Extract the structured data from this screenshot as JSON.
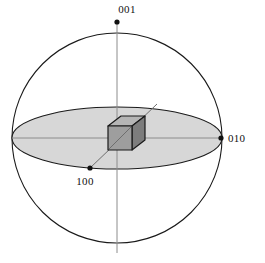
{
  "figure": {
    "background_color": "#ffffff",
    "sphere": {
      "name": "reference-sphere",
      "center_x": 117,
      "center_y": 138,
      "radius": 105,
      "stroke_color": "#1a1a1a",
      "stroke_width": 1.1,
      "fill_color": "none"
    },
    "equatorial_plane": {
      "name": "equatorial-plane-ellipse",
      "center_x": 117,
      "center_y": 138,
      "radius_x": 105,
      "radius_y": 31,
      "fill_color": "#d7d7d7",
      "stroke_color": "#1a1a1a",
      "stroke_width": 1.1
    },
    "cube": {
      "name": "unit-cube",
      "front_face_color": "#9e9e9e",
      "top_face_color": "#b5b5b5",
      "side_face_color": "#7d7d7d",
      "edge_color": "#1a1a1a",
      "edge_width": 1.2,
      "front_left": 108,
      "front_top": 126,
      "front_size": 24,
      "depth_dx": 13,
      "depth_dy": -10
    },
    "axes": [
      {
        "name": "axis-001",
        "label": "001",
        "label_x": 127,
        "label_y": 13,
        "marker_x": 117,
        "marker_y": 22,
        "line_x1": 117,
        "line_y1": 22,
        "line_x2": 117,
        "line_y2": 253,
        "line_color": "#8c8c8c",
        "marker_color": "#111111",
        "marker_radius": 2.6
      },
      {
        "name": "axis-010",
        "label": "010",
        "label_x": 228,
        "label_y": 142,
        "marker_x": 221,
        "marker_y": 138,
        "line_x1": 12,
        "line_y1": 138,
        "line_x2": 221,
        "line_y2": 138,
        "line_color": "#8c8c8c",
        "marker_color": "#111111",
        "marker_radius": 2.6
      },
      {
        "name": "axis-100",
        "label": "100",
        "label_x": 85,
        "label_y": 185,
        "marker_x": 90,
        "marker_y": 168,
        "line_x1": 90,
        "line_y1": 168,
        "line_x2": 157,
        "line_y2": 104,
        "line_color": "#6e6e6e",
        "marker_color": "#111111",
        "marker_radius": 2.6
      }
    ]
  }
}
